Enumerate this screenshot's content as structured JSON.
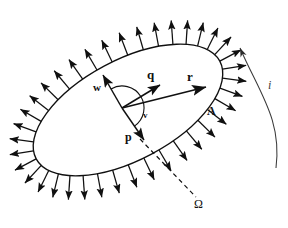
{
  "figure": {
    "type": "vector-diagram",
    "background_color": "#ffffff",
    "stroke_color": "#101010"
  },
  "labels": {
    "q": "q",
    "r": "r",
    "w": "w",
    "v": "v",
    "p": "p",
    "A": "A",
    "i": "i",
    "omega": "Ω"
  },
  "elements": {
    "loop": {
      "name": "ellipse-loop",
      "center_x": 128,
      "center_y": 110,
      "radius_x": 104,
      "radius_y": 50,
      "rotation_deg": -28
    },
    "field_arrows": {
      "name": "outward-normal-arrows",
      "count": 38,
      "length": 24
    },
    "vectors": [
      {
        "name": "vector-q",
        "label": "q",
        "from_x": 122,
        "from_y": 108,
        "to_x": 160,
        "to_y": 85
      },
      {
        "name": "vector-r",
        "label": "r",
        "from_x": 122,
        "from_y": 108,
        "to_x": 206,
        "to_y": 87
      },
      {
        "name": "vector-w",
        "label": "w",
        "from_x": 122,
        "from_y": 108,
        "to_x": 103,
        "to_y": 75
      },
      {
        "name": "vector-v",
        "label": "v",
        "from_x": 122,
        "from_y": 108,
        "to_x": 144,
        "to_y": 140
      }
    ],
    "arc": {
      "name": "angle-arc",
      "radius": 22
    },
    "dashed_line": {
      "name": "omega-dashed-line",
      "from_x": 140,
      "from_y": 139,
      "to_x": 196,
      "to_y": 197
    },
    "current_arc": {
      "name": "current-direction-arc",
      "label": "i",
      "from_x": 276,
      "from_y": 168,
      "to_x": 240,
      "to_y": 48
    }
  },
  "label_positions": {
    "q": {
      "x": 147,
      "y": 68
    },
    "r": {
      "x": 187,
      "y": 70
    },
    "w": {
      "x": 93,
      "y": 82
    },
    "v": {
      "x": 143,
      "y": 111
    },
    "p": {
      "x": 125,
      "y": 131
    },
    "A": {
      "x": 207,
      "y": 105
    },
    "i": {
      "x": 268,
      "y": 79
    },
    "omega": {
      "x": 194,
      "y": 198
    }
  }
}
